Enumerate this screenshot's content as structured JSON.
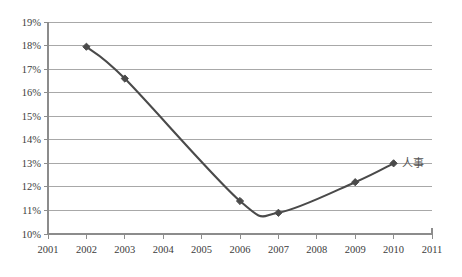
{
  "chart_data": {
    "type": "line",
    "title": "",
    "subtitle": "",
    "xlabel": "",
    "ylabel": "",
    "x": [
      2001,
      2002,
      2003,
      2004,
      2005,
      2006,
      2007,
      2008,
      2009,
      2010,
      2011
    ],
    "categories": [
      "2001",
      "2002",
      "2003",
      "2004",
      "2005",
      "2006",
      "2007",
      "2008",
      "2009",
      "2010",
      "2011"
    ],
    "xlim": [
      2001,
      2011
    ],
    "ylim": [
      10,
      19
    ],
    "ytick_values": [
      10,
      11,
      12,
      13,
      14,
      15,
      16,
      17,
      18,
      19
    ],
    "ytick_labels": [
      "10%",
      "11%",
      "12%",
      "13%",
      "14%",
      "15%",
      "16%",
      "17%",
      "18%",
      "19%"
    ],
    "xtick_labels": [
      "2001",
      "2002",
      "2003",
      "2004",
      "2005",
      "2006",
      "2007",
      "2008",
      "2009",
      "2010",
      "2011"
    ],
    "grid": "horizontal",
    "legend": "none",
    "series": [
      {
        "name": "人事",
        "marker": "diamond",
        "color": "#4a4a4a",
        "points": [
          {
            "x": 2002,
            "y": 17.95,
            "label": ""
          },
          {
            "x": 2003,
            "y": 16.6,
            "label": ""
          },
          {
            "x": 2006,
            "y": 11.4,
            "label": ""
          },
          {
            "x": 2007,
            "y": 10.9,
            "label": ""
          },
          {
            "x": 2009,
            "y": 12.2,
            "label": ""
          },
          {
            "x": 2010,
            "y": 13.0,
            "label": ""
          }
        ]
      }
    ],
    "annotations": [
      {
        "text": "人事",
        "x": 2010,
        "y": 13.0,
        "position": "right-of-last-point"
      }
    ]
  },
  "colors": {
    "line": "#4a4a4a",
    "marker": "#4a4a4a",
    "gridline": "#a8a8a8",
    "axis": "#8c8c8c",
    "tick_text": "#3c3c3c",
    "annotation_text": "#555555",
    "background": "#ffffff"
  },
  "axis": {
    "y_label_top": "19%",
    "y_label_bottom": "10%",
    "x_label_left": "2001",
    "x_label_right": "2011"
  }
}
